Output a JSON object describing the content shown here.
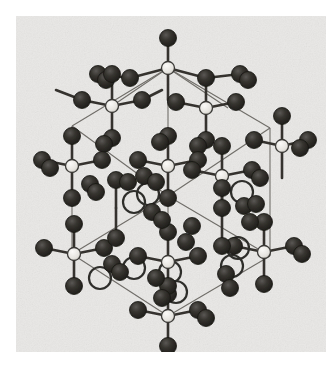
{
  "figure": {
    "kind": "crystal-structure-ball-and-stick-illustration",
    "medium": "scanned halftone print, grayscale",
    "background_color": "#e9e8e6",
    "page_color": "#ffffff",
    "plate": {
      "x": 16,
      "y": 16,
      "width": 310,
      "height": 336
    }
  },
  "legend": {
    "atom_types": [
      {
        "name": "dark-atom",
        "label": "dark sphere",
        "color": "#2b2a28",
        "radius": 8.5
      },
      {
        "name": "light-atom",
        "label": "light sphere (tetrahedral centre)",
        "color": "#e4e2de",
        "radius": 6.5,
        "stroke": "#3a3936"
      },
      {
        "name": "ring-atom",
        "label": "open ring atom",
        "color": "none",
        "radius": 11,
        "stroke": "#2f2e2c"
      }
    ],
    "bond_color": "#35332f",
    "cell_edge_color": "#6a6762"
  },
  "chart_data": {
    "type": "scatter",
    "title": "Crystal structure unit cell, ball-and-stick projection",
    "xlabel": "",
    "ylabel": "",
    "xlim": [
      0,
      310
    ],
    "ylim": [
      0,
      336
    ],
    "grid": false,
    "legend": "none",
    "cell_edges": [
      [
        152,
        52,
        56,
        110
      ],
      [
        152,
        52,
        254,
        112
      ],
      [
        152,
        52,
        152,
        180
      ],
      [
        56,
        110,
        56,
        238
      ],
      [
        254,
        112,
        254,
        240
      ],
      [
        152,
        180,
        56,
        238
      ],
      [
        152,
        180,
        254,
        240
      ],
      [
        56,
        238,
        152,
        300
      ],
      [
        254,
        240,
        152,
        300
      ],
      [
        152,
        180,
        152,
        300
      ],
      [
        56,
        110,
        152,
        180
      ],
      [
        254,
        112,
        152,
        180
      ],
      [
        152,
        52,
        212,
        92
      ],
      [
        152,
        52,
        96,
        90
      ]
    ],
    "bonds": [
      [
        152,
        52,
        152,
        22
      ],
      [
        152,
        52,
        114,
        62
      ],
      [
        152,
        52,
        190,
        62
      ],
      [
        152,
        52,
        152,
        84
      ],
      [
        114,
        62,
        82,
        58
      ],
      [
        190,
        62,
        224,
        58
      ],
      [
        96,
        90,
        96,
        58
      ],
      [
        96,
        90,
        66,
        84
      ],
      [
        96,
        90,
        126,
        84
      ],
      [
        96,
        90,
        96,
        122
      ],
      [
        66,
        84,
        40,
        74
      ],
      [
        126,
        84,
        146,
        74
      ],
      [
        190,
        92,
        190,
        62
      ],
      [
        190,
        92,
        160,
        86
      ],
      [
        190,
        92,
        220,
        86
      ],
      [
        190,
        92,
        190,
        124
      ],
      [
        266,
        130,
        266,
        100
      ],
      [
        266,
        130,
        238,
        124
      ],
      [
        266,
        130,
        292,
        124
      ],
      [
        266,
        130,
        266,
        162
      ],
      [
        56,
        150,
        26,
        144
      ],
      [
        56,
        150,
        86,
        144
      ],
      [
        56,
        150,
        56,
        120
      ],
      [
        56,
        150,
        56,
        182
      ],
      [
        152,
        150,
        122,
        144
      ],
      [
        152,
        150,
        182,
        144
      ],
      [
        152,
        150,
        152,
        120
      ],
      [
        152,
        150,
        152,
        182
      ],
      [
        206,
        160,
        176,
        154
      ],
      [
        206,
        160,
        236,
        154
      ],
      [
        206,
        160,
        206,
        130
      ],
      [
        206,
        160,
        206,
        192
      ],
      [
        58,
        238,
        28,
        232
      ],
      [
        58,
        238,
        88,
        232
      ],
      [
        58,
        238,
        58,
        208
      ],
      [
        58,
        238,
        58,
        270
      ],
      [
        152,
        246,
        122,
        240
      ],
      [
        152,
        246,
        182,
        240
      ],
      [
        152,
        246,
        152,
        216
      ],
      [
        152,
        246,
        152,
        278
      ],
      [
        248,
        236,
        218,
        230
      ],
      [
        248,
        236,
        278,
        230
      ],
      [
        248,
        236,
        248,
        206
      ],
      [
        248,
        236,
        248,
        268
      ],
      [
        152,
        300,
        122,
        294
      ],
      [
        152,
        300,
        182,
        294
      ],
      [
        152,
        300,
        152,
        270
      ],
      [
        152,
        300,
        152,
        330
      ],
      [
        100,
        192,
        100,
        164
      ],
      [
        100,
        192,
        100,
        222
      ],
      [
        206,
        200,
        206,
        172
      ],
      [
        206,
        200,
        206,
        230
      ]
    ],
    "atoms": [
      {
        "type": "light-atom",
        "x": 152,
        "y": 52
      },
      {
        "type": "dark-atom",
        "x": 152,
        "y": 22
      },
      {
        "type": "dark-atom",
        "x": 114,
        "y": 62
      },
      {
        "type": "dark-atom",
        "x": 190,
        "y": 62
      },
      {
        "type": "dark-atom",
        "x": 82,
        "y": 58
      },
      {
        "type": "dark-atom",
        "x": 90,
        "y": 64
      },
      {
        "type": "dark-atom",
        "x": 224,
        "y": 58
      },
      {
        "type": "dark-atom",
        "x": 232,
        "y": 64
      },
      {
        "type": "light-atom",
        "x": 96,
        "y": 90
      },
      {
        "type": "dark-atom",
        "x": 96,
        "y": 58
      },
      {
        "type": "dark-atom",
        "x": 66,
        "y": 84
      },
      {
        "type": "dark-atom",
        "x": 126,
        "y": 84
      },
      {
        "type": "dark-atom",
        "x": 96,
        "y": 122
      },
      {
        "type": "dark-atom",
        "x": 88,
        "y": 128
      },
      {
        "type": "light-atom",
        "x": 190,
        "y": 92
      },
      {
        "type": "dark-atom",
        "x": 160,
        "y": 86
      },
      {
        "type": "dark-atom",
        "x": 220,
        "y": 86
      },
      {
        "type": "dark-atom",
        "x": 190,
        "y": 124
      },
      {
        "type": "dark-atom",
        "x": 182,
        "y": 130
      },
      {
        "type": "light-atom",
        "x": 266,
        "y": 130
      },
      {
        "type": "dark-atom",
        "x": 266,
        "y": 100
      },
      {
        "type": "dark-atom",
        "x": 238,
        "y": 124
      },
      {
        "type": "dark-atom",
        "x": 292,
        "y": 124
      },
      {
        "type": "dark-atom",
        "x": 284,
        "y": 132
      },
      {
        "type": "light-atom",
        "x": 56,
        "y": 150
      },
      {
        "type": "dark-atom",
        "x": 26,
        "y": 144
      },
      {
        "type": "dark-atom",
        "x": 34,
        "y": 152
      },
      {
        "type": "dark-atom",
        "x": 86,
        "y": 144
      },
      {
        "type": "dark-atom",
        "x": 56,
        "y": 120
      },
      {
        "type": "dark-atom",
        "x": 56,
        "y": 182
      },
      {
        "type": "light-atom",
        "x": 152,
        "y": 150
      },
      {
        "type": "dark-atom",
        "x": 122,
        "y": 144
      },
      {
        "type": "dark-atom",
        "x": 182,
        "y": 144
      },
      {
        "type": "dark-atom",
        "x": 152,
        "y": 120
      },
      {
        "type": "dark-atom",
        "x": 144,
        "y": 126
      },
      {
        "type": "dark-atom",
        "x": 152,
        "y": 182
      },
      {
        "type": "light-atom",
        "x": 206,
        "y": 160
      },
      {
        "type": "dark-atom",
        "x": 176,
        "y": 154
      },
      {
        "type": "dark-atom",
        "x": 236,
        "y": 154
      },
      {
        "type": "dark-atom",
        "x": 244,
        "y": 162
      },
      {
        "type": "dark-atom",
        "x": 206,
        "y": 130
      },
      {
        "type": "dark-atom",
        "x": 206,
        "y": 192
      },
      {
        "type": "ring-atom",
        "x": 132,
        "y": 178
      },
      {
        "type": "ring-atom",
        "x": 118,
        "y": 186
      },
      {
        "type": "ring-atom",
        "x": 226,
        "y": 176
      },
      {
        "type": "ring-atom",
        "x": 118,
        "y": 252
      },
      {
        "type": "ring-atom",
        "x": 84,
        "y": 262
      },
      {
        "type": "ring-atom",
        "x": 154,
        "y": 256
      },
      {
        "type": "ring-atom",
        "x": 160,
        "y": 276
      },
      {
        "type": "ring-atom",
        "x": 222,
        "y": 232
      },
      {
        "type": "ring-atom",
        "x": 216,
        "y": 250
      },
      {
        "type": "light-atom",
        "x": 58,
        "y": 238
      },
      {
        "type": "dark-atom",
        "x": 28,
        "y": 232
      },
      {
        "type": "dark-atom",
        "x": 88,
        "y": 232
      },
      {
        "type": "dark-atom",
        "x": 58,
        "y": 208
      },
      {
        "type": "dark-atom",
        "x": 58,
        "y": 270
      },
      {
        "type": "light-atom",
        "x": 152,
        "y": 246
      },
      {
        "type": "dark-atom",
        "x": 122,
        "y": 240
      },
      {
        "type": "dark-atom",
        "x": 182,
        "y": 240
      },
      {
        "type": "dark-atom",
        "x": 152,
        "y": 216
      },
      {
        "type": "dark-atom",
        "x": 152,
        "y": 278
      },
      {
        "type": "light-atom",
        "x": 248,
        "y": 236
      },
      {
        "type": "dark-atom",
        "x": 218,
        "y": 230
      },
      {
        "type": "dark-atom",
        "x": 278,
        "y": 230
      },
      {
        "type": "dark-atom",
        "x": 286,
        "y": 238
      },
      {
        "type": "dark-atom",
        "x": 248,
        "y": 206
      },
      {
        "type": "dark-atom",
        "x": 248,
        "y": 268
      },
      {
        "type": "light-atom",
        "x": 152,
        "y": 300
      },
      {
        "type": "dark-atom",
        "x": 122,
        "y": 294
      },
      {
        "type": "dark-atom",
        "x": 182,
        "y": 294
      },
      {
        "type": "dark-atom",
        "x": 190,
        "y": 302
      },
      {
        "type": "dark-atom",
        "x": 152,
        "y": 270
      },
      {
        "type": "dark-atom",
        "x": 152,
        "y": 330
      },
      {
        "type": "dark-atom",
        "x": 100,
        "y": 164
      },
      {
        "type": "dark-atom",
        "x": 100,
        "y": 222
      },
      {
        "type": "dark-atom",
        "x": 206,
        "y": 172
      },
      {
        "type": "dark-atom",
        "x": 206,
        "y": 230
      },
      {
        "type": "dark-atom",
        "x": 74,
        "y": 168
      },
      {
        "type": "dark-atom",
        "x": 80,
        "y": 176
      },
      {
        "type": "dark-atom",
        "x": 112,
        "y": 166
      },
      {
        "type": "dark-atom",
        "x": 128,
        "y": 160
      },
      {
        "type": "dark-atom",
        "x": 140,
        "y": 166
      },
      {
        "type": "dark-atom",
        "x": 136,
        "y": 196
      },
      {
        "type": "dark-atom",
        "x": 146,
        "y": 204
      },
      {
        "type": "dark-atom",
        "x": 228,
        "y": 190
      },
      {
        "type": "dark-atom",
        "x": 234,
        "y": 206
      },
      {
        "type": "dark-atom",
        "x": 240,
        "y": 188
      },
      {
        "type": "dark-atom",
        "x": 96,
        "y": 248
      },
      {
        "type": "dark-atom",
        "x": 104,
        "y": 256
      },
      {
        "type": "dark-atom",
        "x": 140,
        "y": 262
      },
      {
        "type": "dark-atom",
        "x": 146,
        "y": 282
      },
      {
        "type": "dark-atom",
        "x": 210,
        "y": 258
      },
      {
        "type": "dark-atom",
        "x": 214,
        "y": 272
      },
      {
        "type": "dark-atom",
        "x": 176,
        "y": 210
      },
      {
        "type": "dark-atom",
        "x": 170,
        "y": 226
      }
    ]
  }
}
